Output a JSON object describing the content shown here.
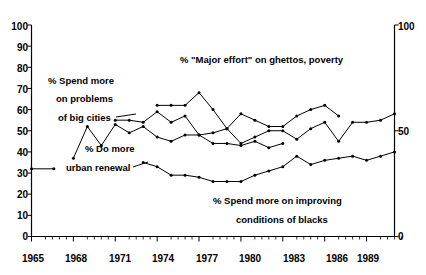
{
  "chart_data": {
    "type": "line",
    "title": "",
    "subtitle": "",
    "xlabel": "",
    "ylabel": "",
    "xlim": [
      1965,
      1991
    ],
    "ylim": [
      0,
      100
    ],
    "grid": false,
    "legend_position": "inline-annotations",
    "x_tick_labels": [
      "1965",
      "1968",
      "1971",
      "1974",
      "1977",
      "1980",
      "1983",
      "1986",
      "1989"
    ],
    "x_tick_values": [
      1965,
      1968,
      1971,
      1974,
      1977,
      1980,
      1983,
      1986,
      1989
    ],
    "y_left_tick_labels": [
      "0",
      "10",
      "20",
      "30",
      "40",
      "50",
      "60",
      "70",
      "80",
      "90",
      "100"
    ],
    "y_left_tick_values": [
      0,
      10,
      20,
      30,
      40,
      50,
      60,
      70,
      80,
      90,
      100
    ],
    "y_right_tick_labels": [
      "0",
      "50",
      "100"
    ],
    "y_right_tick_values": [
      0,
      50,
      100
    ],
    "minor_tick_interval": 1,
    "series": [
      {
        "name": "% \"Major effort\" on ghettos, poverty",
        "annotation": "% \"Major effort\" on ghettos, poverty",
        "color": "#000000",
        "x": [
          1974,
          1975,
          1976,
          1977,
          1978,
          1979,
          1980,
          1981,
          1982,
          1983,
          1984,
          1985,
          1986,
          1987
        ],
        "values": [
          62,
          62,
          62,
          68,
          60,
          51,
          58,
          55,
          52,
          52,
          57,
          60,
          62,
          57
        ]
      },
      {
        "name": "% Spend more on problems of big cities",
        "annotation": "% Spend more on problems of big cities",
        "color": "#000000",
        "x": [
          1971,
          1972,
          1973,
          1974,
          1975,
          1976,
          1977,
          1978,
          1979,
          1980,
          1981,
          1982,
          1983,
          1984,
          1985,
          1986,
          1987,
          1988,
          1989,
          1990,
          1991
        ],
        "values": [
          55,
          55,
          54,
          59,
          54,
          57,
          48,
          49,
          51,
          44,
          47,
          50,
          50,
          46,
          51,
          54,
          45,
          54,
          54,
          55,
          58
        ]
      },
      {
        "name": "% Do more urban renewal",
        "annotation": "% Do more urban renewal",
        "color": "#000000",
        "x": [
          1968,
          1969,
          1970,
          1971,
          1972,
          1973,
          1974,
          1975,
          1976,
          1977,
          1978,
          1979,
          1980,
          1981,
          1982,
          1983
        ],
        "values": [
          37,
          52,
          43,
          53,
          49,
          52,
          47,
          45,
          48,
          48,
          44,
          44,
          43,
          45,
          42,
          44
        ]
      },
      {
        "name": "% Spend more on improving conditions of blacks",
        "annotation": "% Spend more on improving conditions of blacks",
        "color": "#000000",
        "x": [
          1973,
          1974,
          1975,
          1976,
          1977,
          1978,
          1979,
          1980,
          1981,
          1982,
          1983,
          1984,
          1985,
          1986,
          1987,
          1988,
          1989,
          1990,
          1991
        ],
        "values": [
          35,
          33,
          29,
          29,
          28,
          26,
          26,
          26,
          29,
          31,
          33,
          38,
          34,
          36,
          37,
          38,
          36,
          38,
          40
        ]
      }
    ]
  },
  "annotations": [
    {
      "id": "ann-major-effort",
      "text": "% \"Major effort\" on ghettos, poverty"
    },
    {
      "id": "ann-big-cities-l1",
      "text": "% Spend more"
    },
    {
      "id": "ann-big-cities-l2",
      "text": "on problems"
    },
    {
      "id": "ann-big-cities-l3",
      "text": "of big cities"
    },
    {
      "id": "ann-urban-renewal-l1",
      "text": "% Do more"
    },
    {
      "id": "ann-urban-renewal-l2",
      "text": "urban renewal"
    },
    {
      "id": "ann-blacks-l1",
      "text": "% Spend more on improving"
    },
    {
      "id": "ann-blacks-l2",
      "text": "conditions of blacks"
    }
  ],
  "axis": {
    "y_left": {
      "labels": [
        "100",
        "90",
        "80",
        "70",
        "60",
        "50",
        "40",
        "30",
        "20",
        "10",
        "0"
      ]
    },
    "y_right": {
      "labels": [
        "100",
        "50",
        "0"
      ]
    },
    "x": {
      "labels": [
        "1965",
        "1968",
        "1971",
        "1974",
        "1977",
        "1980",
        "1983",
        "1986",
        "1989"
      ]
    }
  }
}
